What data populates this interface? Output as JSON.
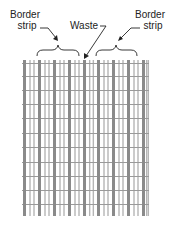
{
  "labels": {
    "left_border_line1": "Border",
    "left_border_line2": "strip",
    "waste": "Waste",
    "right_border_line1": "Border",
    "right_border_line2": "strip"
  },
  "grid": {
    "left": 22,
    "top": 60,
    "right": 149,
    "bottom": 216,
    "thick_bar_x": [
      23,
      38,
      53,
      68,
      83,
      97,
      112,
      127,
      142
    ],
    "thick_bar_width": 3,
    "thin_bars_per_gap": 2,
    "thin_bar_width": 1.4,
    "row_lines_y": [
      63,
      76,
      90,
      104,
      118,
      133,
      147,
      162,
      176,
      190,
      204
    ],
    "colors": {
      "thick": "#8a8a8a",
      "thin": "#b5b5b5",
      "row": "#9a9a9a"
    }
  }
}
